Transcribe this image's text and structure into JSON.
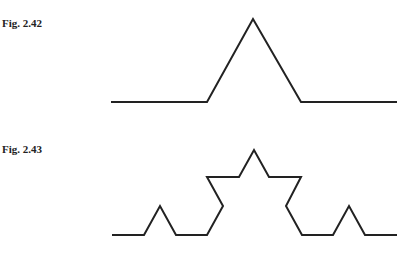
{
  "figures": [
    {
      "label": "Fig. 2.42",
      "points": [
        [
          111,
          102
        ],
        [
          207,
          102
        ],
        [
          253,
          19
        ],
        [
          301,
          102
        ],
        [
          397,
          102
        ]
      ]
    },
    {
      "label": "Fig. 2.43",
      "points": [
        [
          112,
          235
        ],
        [
          144,
          235
        ],
        [
          160,
          206
        ],
        [
          176,
          235
        ],
        [
          207,
          235
        ],
        [
          223,
          206
        ],
        [
          207,
          177
        ],
        [
          239,
          177
        ],
        [
          254,
          150
        ],
        [
          269,
          177
        ],
        [
          301,
          177
        ],
        [
          286,
          206
        ],
        [
          302,
          235
        ],
        [
          333,
          235
        ],
        [
          349,
          206
        ],
        [
          365,
          235
        ],
        [
          397,
          235
        ]
      ]
    }
  ],
  "style": {
    "stroke": "#222222",
    "stroke_width": 2
  }
}
